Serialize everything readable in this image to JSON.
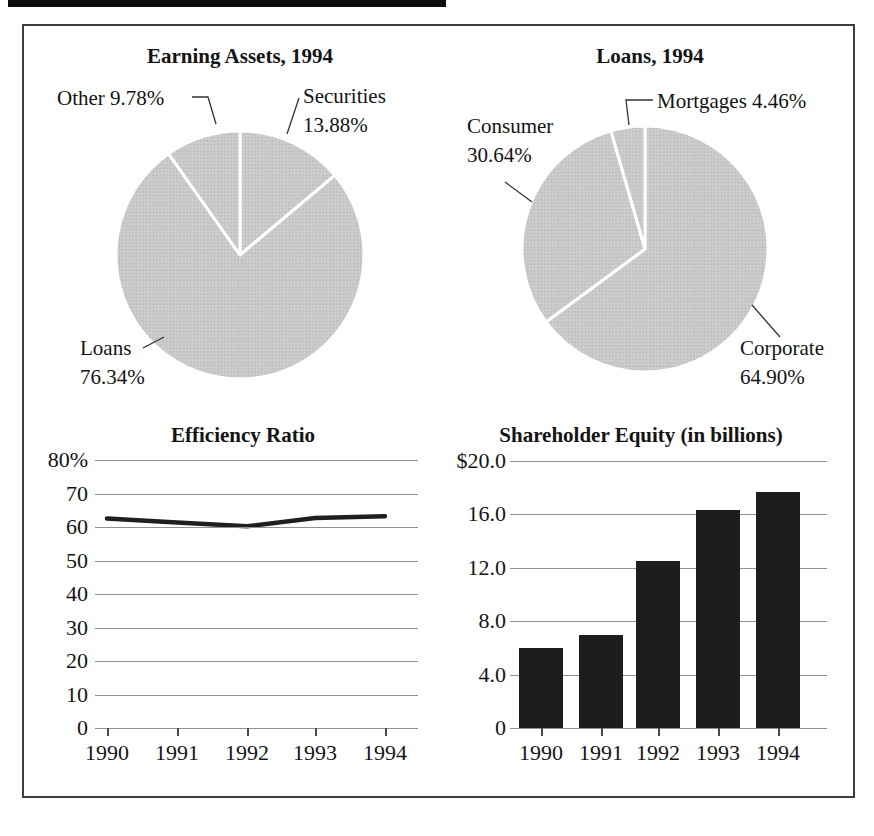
{
  "colors": {
    "pie_fill": "#cdcdcd",
    "pie_dot": "#b7b7b7",
    "pie_divider": "#ffffff",
    "bar_fill": "#1d1d1d",
    "line_stroke": "#1f1f1f",
    "grid": "#929292",
    "frame": "#3e3e3e",
    "text": "#141414"
  },
  "chart_data": [
    {
      "type": "pie",
      "title": "Earning Assets, 1994",
      "direction": "clockwise-from-top",
      "slices": [
        {
          "label": "Securities",
          "pct": "13.88%",
          "value": 13.88
        },
        {
          "label": "Loans",
          "pct": "76.34%",
          "value": 76.34
        },
        {
          "label": "Other",
          "pct": "9.78%",
          "value": 9.78
        }
      ]
    },
    {
      "type": "pie",
      "title": "Loans, 1994",
      "direction": "clockwise-from-top",
      "slices": [
        {
          "label": "Corporate",
          "pct": "64.90%",
          "value": 64.9
        },
        {
          "label": "Consumer",
          "pct": "30.64%",
          "value": 30.64
        },
        {
          "label": "Mortgages",
          "pct": "4.46%",
          "value": 4.46
        }
      ]
    },
    {
      "type": "line",
      "title": "Efficiency Ratio",
      "x": [
        "1990",
        "1991",
        "1992",
        "1993",
        "1994"
      ],
      "values": [
        62.5,
        61.3,
        60.2,
        62.7,
        63.2
      ],
      "ylim": [
        0,
        80
      ],
      "y_ticks": [
        "80%",
        "70",
        "60",
        "50",
        "40",
        "30",
        "20",
        "10",
        "0"
      ],
      "grid": "on",
      "legend": "none"
    },
    {
      "type": "bar",
      "title": "Shareholder Equity (in billions)",
      "x": [
        "1990",
        "1991",
        "1992",
        "1993",
        "1994"
      ],
      "values": [
        6.0,
        7.0,
        12.5,
        16.3,
        17.7
      ],
      "ylim": [
        0,
        20
      ],
      "y_ticks": [
        "$20.0",
        "16.0",
        "12.0",
        "8.0",
        "4.0",
        "0"
      ],
      "grid": "on",
      "legend": "none"
    }
  ]
}
